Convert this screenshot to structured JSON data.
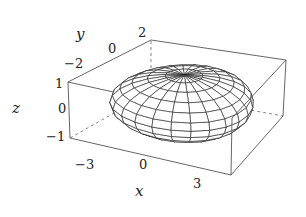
{
  "chart_data": {
    "type": "surface3d",
    "title": "",
    "surface": "ellipsoid (wireframe)",
    "ellipsoid_semi_axes": {
      "x": 2.6,
      "y": 1.9,
      "z": 1.0
    },
    "mesh": {
      "meridians": 24,
      "parallels": 12
    },
    "xlabel": "x",
    "ylabel": "y",
    "zlabel": "z",
    "xlim": [
      -3,
      3
    ],
    "ylim": [
      -2,
      2
    ],
    "zlim": [
      -1,
      1
    ],
    "xticks": [
      "−3",
      "0",
      "3"
    ],
    "yticks": [
      "−2",
      "0",
      "2"
    ],
    "zticks": [
      "1",
      "0",
      "−1"
    ],
    "grid": false,
    "legend": null,
    "colors": {
      "mesh": "#222222",
      "box": "#555555",
      "background": "#ffffff"
    }
  },
  "projection_corners": {
    "m3_m2_p1": [
      68,
      82
    ],
    "m3_m2_m1": [
      70,
      138
    ],
    "p3_m2_m1": [
      231,
      175
    ],
    "p3_m2_p1": [
      232,
      118
    ],
    "m3_p2_p1": [
      151,
      40
    ],
    "m3_p2_m1": [
      151,
      92
    ],
    "p3_p2_p1": [
      286,
      60
    ],
    "p3_p2_m1": [
      283,
      116
    ]
  }
}
